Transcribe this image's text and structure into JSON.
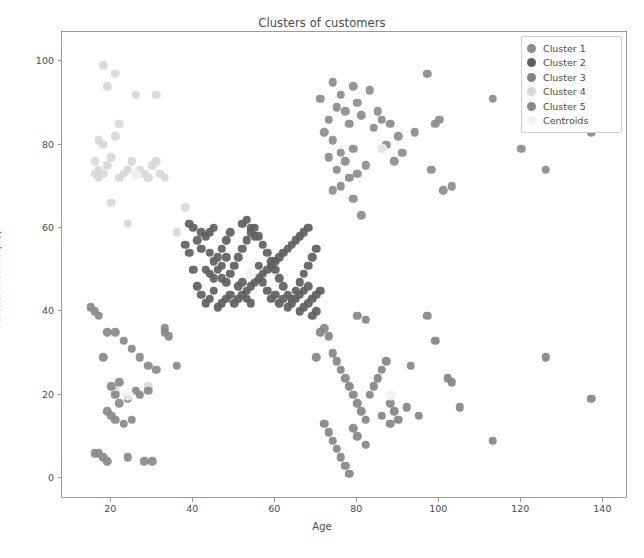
{
  "chart_data": {
    "type": "scatter",
    "title": "Clusters of customers",
    "xlabel": "Age",
    "ylabel": "Annual Income (k$)",
    "xlim": [
      8,
      146
    ],
    "ylim": [
      -5,
      107
    ],
    "xticks": [
      20,
      40,
      60,
      80,
      100,
      120,
      140
    ],
    "yticks": [
      0,
      20,
      40,
      60,
      80,
      100
    ],
    "grid": false,
    "legend_position": "upper right",
    "marker_size": 7,
    "colors": {
      "cluster1": "#8c8c8c",
      "cluster2": "#606060",
      "cluster3": "#858585",
      "cluster4": "#d8d8d8",
      "cluster5": "#8a8a8a",
      "centroids": "#f2f2f2",
      "axis": "#9a9a9a",
      "text": "#4a4a4a",
      "background": "#ffffff"
    },
    "legend": [
      {
        "label": "Cluster 1",
        "color": "#8c8c8c"
      },
      {
        "label": "Cluster 2",
        "color": "#606060"
      },
      {
        "label": "Cluster 3",
        "color": "#858585"
      },
      {
        "label": "Cluster 4",
        "color": "#d8d8d8"
      },
      {
        "label": "Cluster 5",
        "color": "#8a8a8a"
      },
      {
        "label": "Centroids",
        "color": "#f2f2f2"
      }
    ],
    "series": [
      {
        "name": "Cluster 1",
        "color": "#8c8c8c",
        "points": [
          [
            71,
            91
          ],
          [
            74,
            95
          ],
          [
            75,
            89
          ],
          [
            76,
            92
          ],
          [
            77,
            88
          ],
          [
            79,
            94
          ],
          [
            80,
            90
          ],
          [
            73,
            86
          ],
          [
            78,
            85
          ],
          [
            72,
            83
          ],
          [
            74,
            81
          ],
          [
            76,
            78
          ],
          [
            77,
            76
          ],
          [
            75,
            74
          ],
          [
            73,
            77
          ],
          [
            79,
            79
          ],
          [
            81,
            87
          ],
          [
            83,
            93
          ],
          [
            85,
            88
          ],
          [
            84,
            84
          ],
          [
            86,
            86
          ],
          [
            88,
            85
          ],
          [
            87,
            80
          ],
          [
            90,
            82
          ],
          [
            82,
            75
          ],
          [
            80,
            73
          ],
          [
            78,
            72
          ],
          [
            76,
            70
          ],
          [
            74,
            69
          ],
          [
            79,
            67
          ],
          [
            81,
            63
          ],
          [
            86,
            79
          ],
          [
            89,
            76
          ],
          [
            91,
            78
          ],
          [
            94,
            83
          ],
          [
            97,
            97
          ],
          [
            99,
            85
          ],
          [
            100,
            86
          ],
          [
            98,
            74
          ],
          [
            101,
            69
          ],
          [
            103,
            70
          ],
          [
            113,
            91
          ],
          [
            120,
            79
          ],
          [
            126,
            74
          ],
          [
            137,
            83
          ]
        ]
      },
      {
        "name": "Cluster 2",
        "color": "#606060",
        "points": [
          [
            39,
            61
          ],
          [
            40,
            60
          ],
          [
            41,
            57
          ],
          [
            42,
            55
          ],
          [
            43,
            58
          ],
          [
            44,
            54
          ],
          [
            45,
            52
          ],
          [
            46,
            50
          ],
          [
            47,
            48
          ],
          [
            48,
            47
          ],
          [
            49,
            49
          ],
          [
            50,
            51
          ],
          [
            51,
            53
          ],
          [
            52,
            55
          ],
          [
            53,
            57
          ],
          [
            54,
            59
          ],
          [
            55,
            60
          ],
          [
            56,
            58
          ],
          [
            57,
            56
          ],
          [
            58,
            54
          ],
          [
            59,
            52
          ],
          [
            60,
            50
          ],
          [
            61,
            48
          ],
          [
            62,
            46
          ],
          [
            63,
            44
          ],
          [
            64,
            43
          ],
          [
            65,
            45
          ],
          [
            66,
            47
          ],
          [
            67,
            49
          ],
          [
            68,
            51
          ],
          [
            69,
            53
          ],
          [
            70,
            55
          ],
          [
            41,
            46
          ],
          [
            42,
            44
          ],
          [
            43,
            42
          ],
          [
            44,
            43
          ],
          [
            45,
            45
          ],
          [
            46,
            41
          ],
          [
            47,
            42
          ],
          [
            48,
            43
          ],
          [
            49,
            44
          ],
          [
            50,
            42
          ],
          [
            51,
            43
          ],
          [
            52,
            44
          ],
          [
            53,
            45
          ],
          [
            54,
            46
          ],
          [
            55,
            47
          ],
          [
            56,
            48
          ],
          [
            57,
            49
          ],
          [
            58,
            50
          ],
          [
            59,
            51
          ],
          [
            60,
            52
          ],
          [
            61,
            53
          ],
          [
            62,
            54
          ],
          [
            63,
            55
          ],
          [
            64,
            56
          ],
          [
            65,
            57
          ],
          [
            66,
            58
          ],
          [
            67,
            59
          ],
          [
            68,
            60
          ],
          [
            60,
            44
          ],
          [
            61,
            42
          ],
          [
            62,
            43
          ],
          [
            63,
            41
          ],
          [
            64,
            42
          ],
          [
            65,
            43
          ],
          [
            66,
            44
          ],
          [
            67,
            45
          ],
          [
            68,
            46
          ],
          [
            38,
            56
          ],
          [
            39,
            54
          ],
          [
            40,
            50
          ],
          [
            43,
            50
          ],
          [
            44,
            49
          ],
          [
            45,
            48
          ],
          [
            46,
            53
          ],
          [
            47,
            55
          ],
          [
            48,
            57
          ],
          [
            49,
            59
          ],
          [
            52,
            61
          ],
          [
            53,
            62
          ],
          [
            54,
            60
          ],
          [
            55,
            58
          ],
          [
            56,
            51
          ],
          [
            57,
            47
          ],
          [
            58,
            45
          ],
          [
            59,
            43
          ],
          [
            66,
            40
          ],
          [
            67,
            41
          ],
          [
            68,
            42
          ],
          [
            69,
            43
          ],
          [
            70,
            44
          ],
          [
            71,
            45
          ],
          [
            70,
            40
          ],
          [
            69,
            39
          ],
          [
            44,
            59
          ],
          [
            45,
            60
          ],
          [
            42,
            59
          ],
          [
            47,
            51
          ],
          [
            48,
            53
          ],
          [
            51,
            46
          ],
          [
            52,
            47
          ],
          [
            53,
            43
          ],
          [
            54,
            42
          ]
        ]
      },
      {
        "name": "Cluster 3",
        "color": "#858585",
        "points": [
          [
            72,
            36
          ],
          [
            73,
            34
          ],
          [
            74,
            30
          ],
          [
            75,
            28
          ],
          [
            76,
            26
          ],
          [
            77,
            24
          ],
          [
            78,
            22
          ],
          [
            79,
            20
          ],
          [
            80,
            18
          ],
          [
            81,
            16
          ],
          [
            82,
            14
          ],
          [
            72,
            13
          ],
          [
            73,
            11
          ],
          [
            74,
            9
          ],
          [
            75,
            7
          ],
          [
            76,
            5
          ],
          [
            77,
            3
          ],
          [
            78,
            1
          ],
          [
            79,
            12
          ],
          [
            80,
            10
          ],
          [
            82,
            8
          ],
          [
            83,
            20
          ],
          [
            84,
            22
          ],
          [
            85,
            24
          ],
          [
            86,
            26
          ],
          [
            87,
            28
          ],
          [
            88,
            18
          ],
          [
            89,
            16
          ],
          [
            90,
            14
          ],
          [
            92,
            17
          ],
          [
            93,
            27
          ],
          [
            95,
            15
          ],
          [
            97,
            39
          ],
          [
            99,
            33
          ],
          [
            102,
            24
          ],
          [
            103,
            23
          ],
          [
            105,
            17
          ],
          [
            113,
            9
          ],
          [
            126,
            29
          ],
          [
            137,
            19
          ],
          [
            71,
            35
          ],
          [
            70,
            29
          ],
          [
            86,
            15
          ],
          [
            88,
            13
          ],
          [
            80,
            39
          ],
          [
            82,
            38
          ]
        ]
      },
      {
        "name": "Cluster 4",
        "color": "#d8d8d8",
        "points": [
          [
            18,
            99
          ],
          [
            21,
            97
          ],
          [
            19,
            94
          ],
          [
            26,
            92
          ],
          [
            31,
            92
          ],
          [
            17,
            81
          ],
          [
            18,
            80
          ],
          [
            16,
            76
          ],
          [
            17,
            74
          ],
          [
            18,
            73
          ],
          [
            19,
            75
          ],
          [
            20,
            77
          ],
          [
            21,
            82
          ],
          [
            22,
            85
          ],
          [
            23,
            73
          ],
          [
            24,
            74
          ],
          [
            25,
            76
          ],
          [
            26,
            73
          ],
          [
            27,
            74
          ],
          [
            28,
            73
          ],
          [
            29,
            72
          ],
          [
            30,
            75
          ],
          [
            31,
            76
          ],
          [
            32,
            73
          ],
          [
            24,
            61
          ],
          [
            20,
            66
          ],
          [
            33,
            72
          ],
          [
            22,
            72
          ],
          [
            16,
            73
          ],
          [
            17,
            72
          ],
          [
            38,
            65
          ],
          [
            36,
            59
          ],
          [
            27,
            20
          ],
          [
            21,
            21
          ],
          [
            29,
            22
          ]
        ]
      },
      {
        "name": "Cluster 5",
        "color": "#8a8a8a",
        "points": [
          [
            15,
            41
          ],
          [
            16,
            40
          ],
          [
            17,
            39
          ],
          [
            19,
            35
          ],
          [
            21,
            35
          ],
          [
            23,
            33
          ],
          [
            25,
            31
          ],
          [
            27,
            29
          ],
          [
            29,
            27
          ],
          [
            31,
            26
          ],
          [
            33,
            35
          ],
          [
            18,
            29
          ],
          [
            20,
            22
          ],
          [
            21,
            20
          ],
          [
            22,
            18
          ],
          [
            19,
            16
          ],
          [
            20,
            15
          ],
          [
            21,
            14
          ],
          [
            23,
            13
          ],
          [
            25,
            14
          ],
          [
            27,
            20
          ],
          [
            29,
            21
          ],
          [
            16,
            6
          ],
          [
            17,
            6
          ],
          [
            18,
            5
          ],
          [
            19,
            4
          ],
          [
            24,
            5
          ],
          [
            28,
            4
          ],
          [
            30,
            4
          ],
          [
            33,
            36
          ],
          [
            34,
            34
          ],
          [
            36,
            27
          ],
          [
            22,
            23
          ],
          [
            24,
            19
          ],
          [
            26,
            21
          ]
        ]
      },
      {
        "name": "Centroids",
        "color": "#f2f2f2",
        "points": [
          [
            86,
            79
          ],
          [
            54,
            49
          ],
          [
            88,
            20
          ],
          [
            26,
            73
          ],
          [
            24,
            20
          ]
        ]
      }
    ]
  }
}
